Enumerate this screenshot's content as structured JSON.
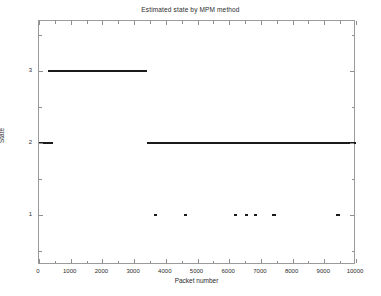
{
  "chart_data": {
    "type": "line",
    "title": "Estimated state by MPM method",
    "xlabel": "Packet number",
    "ylabel": "State",
    "xlim": [
      0,
      10000
    ],
    "ylim": [
      0.3,
      3.7
    ],
    "grid": false,
    "legend": null,
    "xticks": [
      0,
      1000,
      2000,
      3000,
      4000,
      5000,
      6000,
      7000,
      8000,
      9000,
      10000
    ],
    "xticklabels": [
      "0",
      "1000",
      "2000",
      "3000",
      "4000",
      "5000",
      "6000",
      "7000",
      "8000",
      "9000",
      "10000"
    ],
    "xminorticks": [
      500,
      1500,
      2500,
      3500,
      4500,
      5500,
      6500,
      7500,
      8500,
      9500
    ],
    "yticks": [
      1,
      2,
      3
    ],
    "yticklabels": [
      "1",
      "2",
      "3"
    ],
    "yminorticks": [
      0.5,
      1.5,
      2.5,
      3.5
    ],
    "line_color": "#1a1a1a",
    "series": [
      {
        "name": "Estimated state",
        "description": "Piecewise-constant estimated state versus packet number",
        "segments": [
          {
            "state": 2,
            "x_start": 0,
            "x_end": 440
          },
          {
            "state": 3,
            "x_start": 270,
            "x_end": 3400
          },
          {
            "state": 2,
            "x_start": 3400,
            "x_end": 10000
          }
        ],
        "state_one_marks": [
          {
            "x_start": 3620,
            "x_end": 3720
          },
          {
            "x_start": 4570,
            "x_end": 4670
          },
          {
            "x_start": 6160,
            "x_end": 6250
          },
          {
            "x_start": 6490,
            "x_end": 6580
          },
          {
            "x_start": 6780,
            "x_end": 6870
          },
          {
            "x_start": 7350,
            "x_end": 7470
          },
          {
            "x_start": 9380,
            "x_end": 9490
          }
        ]
      }
    ]
  }
}
